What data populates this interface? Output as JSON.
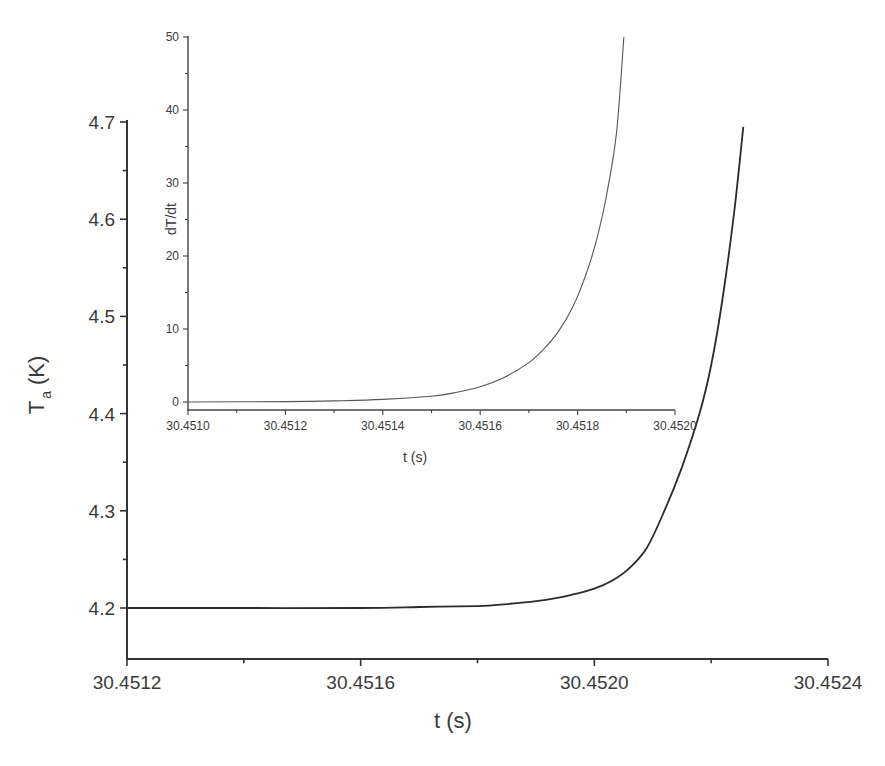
{
  "chart_data": [
    {
      "id": "main",
      "type": "line",
      "title": "",
      "xlabel": "t (s)",
      "ylabel": "T_a (K)",
      "ylabel_main": "T",
      "ylabel_sub": "a",
      "ylabel_unit": "(K)",
      "xlim": [
        30.4512,
        30.4524
      ],
      "ylim": [
        4.147,
        4.7
      ],
      "xticks": [
        "30.4512",
        "30.4516",
        "30.4520",
        "30.4524"
      ],
      "yticks": [
        "4.2",
        "4.3",
        "4.4",
        "4.5",
        "4.6",
        "4.7"
      ],
      "grid": false,
      "series": [
        {
          "name": "T_a",
          "color": "#2b2b2b",
          "x": [
            30.4512,
            30.4514,
            30.4516,
            30.4517,
            30.4518,
            30.45185,
            30.4519,
            30.45195,
            30.452,
            30.45203,
            30.45206,
            30.45209,
            30.45212,
            30.45215,
            30.45218,
            30.4522,
            30.45222,
            30.45224,
            30.452255
          ],
          "y": [
            4.2,
            4.2,
            4.2,
            4.201,
            4.202,
            4.204,
            4.207,
            4.212,
            4.22,
            4.228,
            4.241,
            4.262,
            4.3,
            4.345,
            4.4,
            4.45,
            4.52,
            4.61,
            4.695
          ]
        }
      ]
    },
    {
      "id": "inset",
      "type": "line",
      "title": "",
      "xlabel": "t (s)",
      "ylabel": "dT/dt",
      "xlim": [
        30.451,
        30.452
      ],
      "ylim": [
        -1,
        50
      ],
      "xticks": [
        "30.4510",
        "30.4512",
        "30.4514",
        "30.4516",
        "30.4518",
        "30.4520"
      ],
      "yticks": [
        "0",
        "10",
        "20",
        "30",
        "40",
        "50"
      ],
      "grid": false,
      "series": [
        {
          "name": "dT/dt",
          "color": "#555555",
          "x": [
            30.451,
            30.4512,
            30.4513,
            30.4514,
            30.4515,
            30.45155,
            30.4516,
            30.45165,
            30.4517,
            30.45173,
            30.45176,
            30.45179,
            30.45182,
            30.45184,
            30.45186,
            30.45188,
            30.451895
          ],
          "y": [
            0.0,
            0.05,
            0.15,
            0.35,
            0.8,
            1.3,
            2.1,
            3.4,
            5.4,
            7.2,
            9.6,
            13.0,
            18.0,
            22.5,
            28.5,
            37.0,
            50.0
          ]
        }
      ]
    }
  ]
}
